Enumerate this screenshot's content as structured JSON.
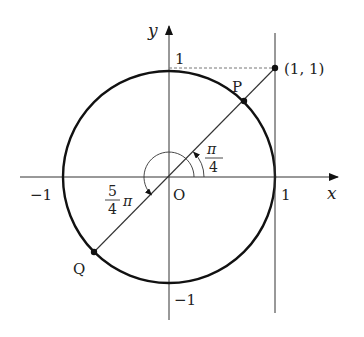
{
  "diagram": {
    "type": "unit-circle",
    "axes": {
      "x_label": "x",
      "y_label": "y",
      "origin_label": "O",
      "ticks": {
        "x_pos": "1",
        "x_neg": "−1",
        "y_pos": "1",
        "y_neg": "−1"
      }
    },
    "points": {
      "P": {
        "label": "P"
      },
      "Q": {
        "label": "Q"
      },
      "tangent_point": {
        "label": "(1, 1)"
      }
    },
    "angles": {
      "small": {
        "numerator": "π",
        "denominator": "4"
      },
      "large": {
        "numerator": "5",
        "denominator": "4",
        "suffix": "π"
      }
    },
    "colors": {
      "stroke": "#222222",
      "thin": "#333333",
      "dashed": "#666666"
    }
  }
}
